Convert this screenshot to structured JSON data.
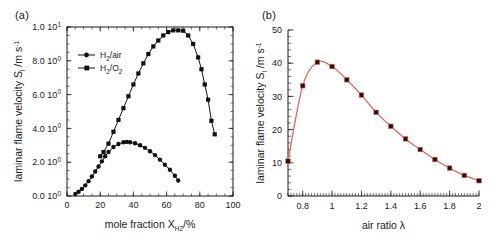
{
  "figure": {
    "panel_a_tag": "(a)",
    "panel_b_tag": "(b)"
  },
  "chart_data": [
    {
      "id": "panel-a",
      "type": "line",
      "title": "",
      "panel_label": "(a)",
      "xlabel": "mole fraction X",
      "xlabel_sub": "H2",
      "xlabel_tail": "/%",
      "ylabel": "laminar flame velocity S",
      "ylabel_sub": "l",
      "ylabel_tail": " /m s",
      "ylabel_sup": "-1",
      "xlim": [
        0,
        100
      ],
      "ylim": [
        0,
        10
      ],
      "xticks": [
        0,
        20,
        40,
        60,
        80,
        100
      ],
      "xticklabels": [
        "0",
        "20",
        "40",
        "60",
        "80",
        "100"
      ],
      "yticks": [
        0,
        2,
        4,
        6,
        8,
        10
      ],
      "yticklabels": [
        "0.0 10",
        "2.0 10",
        "4.0 10",
        "6.0 10",
        "8.0 10",
        "1.0 10"
      ],
      "ytick_exponents": [
        "0",
        "0",
        "0",
        "0",
        "0",
        "1"
      ],
      "grid": false,
      "legend_position": "upper-left",
      "series": [
        {
          "name": "H2/air",
          "label_main": "H",
          "label_sub": "2",
          "label_tail": "/air",
          "color": "#111111",
          "marker": "circle",
          "x": [
            5,
            7,
            9,
            11,
            13,
            15,
            17,
            19,
            21,
            23,
            25,
            28,
            31,
            34,
            36,
            38,
            41,
            44,
            47,
            50,
            53,
            56,
            59,
            62,
            65,
            67
          ],
          "y": [
            0.12,
            0.25,
            0.42,
            0.63,
            0.88,
            1.15,
            1.45,
            1.75,
            2.05,
            2.35,
            2.6,
            2.9,
            3.08,
            3.18,
            3.2,
            3.18,
            3.12,
            3.0,
            2.85,
            2.65,
            2.42,
            2.15,
            1.85,
            1.55,
            1.2,
            0.92
          ]
        },
        {
          "name": "H2/O2",
          "label_main": "H",
          "label_sub": "2",
          "label_tail": "/O",
          "label_sub2": "2",
          "color": "#111111",
          "marker": "square",
          "x": [
            20,
            22,
            25,
            28,
            31,
            34,
            37,
            40,
            43,
            46,
            49,
            52,
            55,
            58,
            61,
            64,
            67,
            70,
            73,
            76,
            79,
            81,
            83,
            85,
            87,
            89
          ],
          "y": [
            2.35,
            2.6,
            3.1,
            3.8,
            4.5,
            5.2,
            5.9,
            6.6,
            7.25,
            7.85,
            8.4,
            8.85,
            9.2,
            9.5,
            9.7,
            9.8,
            9.8,
            9.78,
            9.5,
            9.0,
            8.2,
            7.5,
            6.6,
            5.7,
            4.45,
            3.65
          ]
        }
      ]
    },
    {
      "id": "panel-b",
      "type": "line",
      "title": "",
      "panel_label": "(b)",
      "xlabel": "air ratio λ",
      "ylabel": "laminar flame velocity S",
      "ylabel_sub": "l",
      "ylabel_tail": " /m s",
      "ylabel_sup": "-1",
      "xlim": [
        0.7,
        2.0
      ],
      "ylim": [
        0,
        50
      ],
      "xticks": [
        0.8,
        1.0,
        1.2,
        1.4,
        1.6,
        1.8,
        2.0
      ],
      "xticklabels": [
        "0.8",
        "1",
        "1.2",
        "1.4",
        "1.6",
        "1.8",
        "2"
      ],
      "yticks": [
        0,
        10,
        20,
        30,
        40,
        50
      ],
      "yticklabels": [
        "0",
        "10",
        "20",
        "30",
        "40",
        "50"
      ],
      "grid": false,
      "legend_position": "none",
      "line_color": "#e8665a",
      "marker_color": "#2b1410",
      "series": [
        {
          "name": "laminar flame velocity",
          "color": "#e8665a",
          "marker": "square",
          "x": [
            0.7,
            0.8,
            0.9,
            1.0,
            1.1,
            1.2,
            1.3,
            1.4,
            1.5,
            1.6,
            1.7,
            1.8,
            1.9,
            2.0
          ],
          "y": [
            10.5,
            33.2,
            40.3,
            39.0,
            35.0,
            30.4,
            25.2,
            21.0,
            17.2,
            14.0,
            11.0,
            8.4,
            6.2,
            4.6
          ]
        }
      ]
    }
  ]
}
